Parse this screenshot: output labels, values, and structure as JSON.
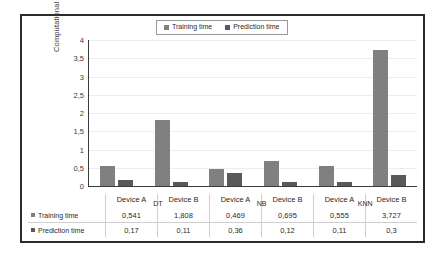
{
  "chart_data": {
    "type": "bar",
    "title": "",
    "xlabel": "",
    "ylabel": "Computational  cost (s)",
    "ylim": [
      0,
      4
    ],
    "ytick_labels": [
      "4",
      "3,5",
      "3",
      "2,5",
      "2",
      "1,5",
      "1",
      "0,5",
      "0"
    ],
    "ytick_values": [
      4,
      3.5,
      3,
      2.5,
      2,
      1.5,
      1,
      0.5,
      0
    ],
    "grid": true,
    "legend_position": "top-center",
    "decimal_separator": ",",
    "categories": [
      "Device A",
      "Device B",
      "Device A",
      "Device B",
      "Device A",
      "Device B"
    ],
    "groups": [
      {
        "label": "DT",
        "categories": [
          "Device A",
          "Device B"
        ]
      },
      {
        "label": "NB",
        "categories": [
          "Device A",
          "Device B"
        ]
      },
      {
        "label": "KNN",
        "categories": [
          "Device A",
          "Device B"
        ]
      }
    ],
    "series": [
      {
        "name": "Training time",
        "color": "#808080",
        "values": [
          0.541,
          1.808,
          0.469,
          0.695,
          0.555,
          3.727
        ],
        "labels": [
          "0,541",
          "1,808",
          "0,469",
          "0,695",
          "0,555",
          "3,727"
        ]
      },
      {
        "name": "Prediction time",
        "color": "#595959",
        "values": [
          0.17,
          0.11,
          0.36,
          0.12,
          0.11,
          0.3
        ],
        "labels": [
          "0,17",
          "0,11",
          "0,36",
          "0,12",
          "0,11",
          "0,3"
        ]
      }
    ]
  },
  "legend": {
    "items": [
      {
        "label": "Training time",
        "color": "#808080"
      },
      {
        "label": "Prediction time",
        "color": "#595959"
      }
    ]
  },
  "data_table": {
    "row_headers": [
      "Training time",
      "Prediction time"
    ],
    "category_row": [
      "Device A",
      "Device B",
      "Device A",
      "Device B",
      "Device A",
      "Device B"
    ],
    "group_row": [
      "DT",
      "NB",
      "KNN"
    ],
    "rows": [
      [
        "0,541",
        "1,808",
        "0,469",
        "0,695",
        "0,555",
        "3,727"
      ],
      [
        "0,17",
        "0,11",
        "0,36",
        "0,12",
        "0,11",
        "0,3"
      ]
    ]
  },
  "colors": {
    "training": "#808080",
    "prediction": "#595959",
    "frame": "#2b2b2b",
    "gridline": "#ededed",
    "axis": "#3a3a3a",
    "table_rule": "#cfcfcf"
  }
}
